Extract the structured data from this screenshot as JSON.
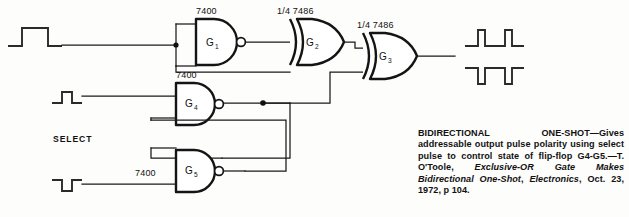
{
  "figure": {
    "select_label": "SELECT"
  },
  "gates": [
    {
      "id": "G1",
      "name": "G",
      "sub": "1",
      "part": "7400",
      "type": "nand",
      "role": "input-inverter"
    },
    {
      "id": "G2",
      "name": "G",
      "sub": "2",
      "part": "1/4 7486",
      "type": "xor",
      "role": "first-exclusive-or"
    },
    {
      "id": "G3",
      "name": "G",
      "sub": "3",
      "part": "1/4 7486",
      "type": "xor",
      "role": "output-exclusive-or"
    },
    {
      "id": "G4",
      "name": "G",
      "sub": "4",
      "part": "7400",
      "type": "nand",
      "role": "latch-upper"
    },
    {
      "id": "G5",
      "name": "G",
      "sub": "5",
      "part": "7400",
      "type": "nand",
      "role": "latch-lower"
    }
  ],
  "waveforms": [
    {
      "id": "input-trigger",
      "polarity": "positive",
      "position": "left-top",
      "pulses": 1
    },
    {
      "id": "select-set-pulse",
      "polarity": "positive",
      "position": "left-middle",
      "pulses": 1
    },
    {
      "id": "select-reset-pulse",
      "polarity": "negative",
      "position": "left-bottom",
      "pulses": 1
    },
    {
      "id": "output-positive",
      "polarity": "positive",
      "position": "right-top",
      "pulses": 2
    },
    {
      "id": "output-negative",
      "polarity": "negative",
      "position": "right-bottom",
      "pulses": 2
    }
  ],
  "caption": {
    "lead": "BIDIRECTIONAL ONE-SHOT—Gives addressable output pulse polarity using select pulse to control state of flip-flop G4-G5.—T. O'Toole, ",
    "article_italic": "Exclusive-OR Gate Makes Bidirectional One-Shot",
    "mid": ", ",
    "publication_italic": "Electronics",
    "tail": ", Oct. 23, 1972, p 104."
  },
  "colors": {
    "background": "#fdfdfc",
    "ink": "#111111",
    "wire": "#1a1a1a",
    "gate_outline": "#141414"
  }
}
